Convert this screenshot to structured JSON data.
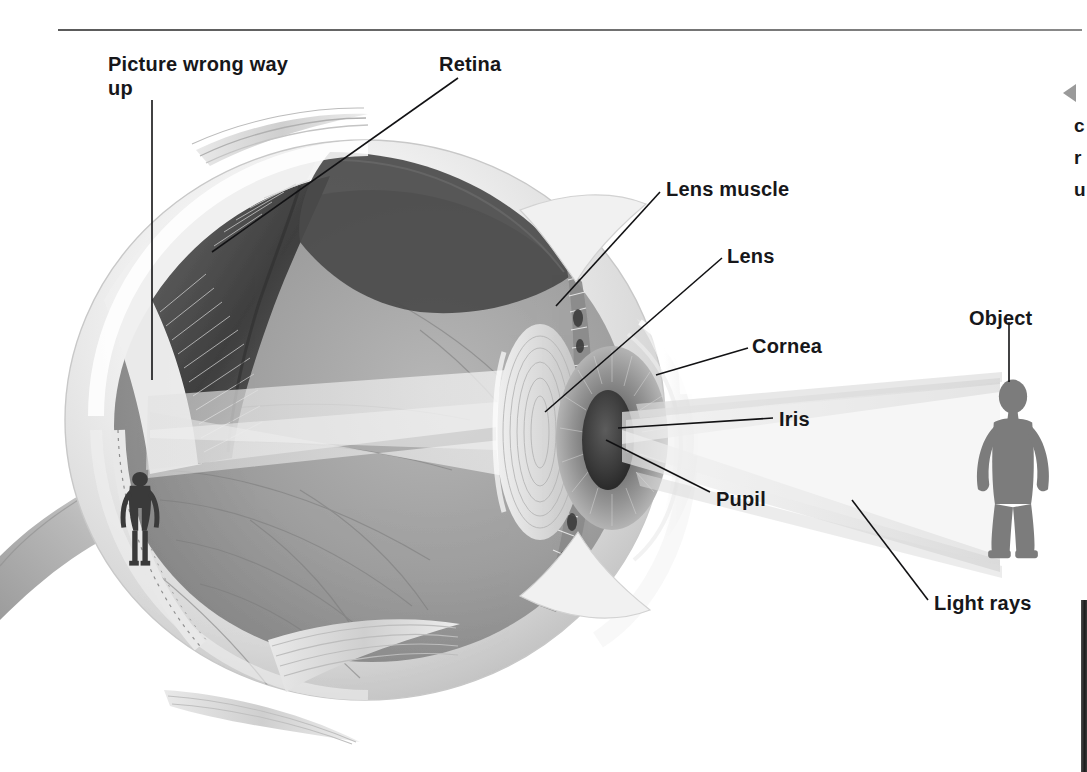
{
  "page": {
    "background_color": "#ffffff",
    "ink_color": "#17171a",
    "rule_color": "#5a5a5a"
  },
  "diagram": {
    "type": "anatomical-cutaway",
    "palette": {
      "sclera_light": "#f4f4f4",
      "sclera_mid": "#dcdcdc",
      "vitreous": "#9a9a9a",
      "choroid_dark": "#4d4d4d",
      "retina_shadow": "#6f6f6f",
      "light_ray": "#e9e9e9",
      "figure_gray": "#7c7c7c",
      "lens_gray": "#d9d9d9",
      "iris_gray": "#8e8e8e",
      "pupil_dark": "#3a3a3a"
    }
  },
  "labels": [
    {
      "id": "picture-wrong-way-up",
      "text": "Picture wrong way up",
      "x": 108,
      "y": 53
    },
    {
      "id": "retina",
      "text": "Retina",
      "x": 439,
      "y": 53
    },
    {
      "id": "lens-muscle",
      "text": "Lens muscle",
      "x": 666,
      "y": 178
    },
    {
      "id": "lens",
      "text": "Lens",
      "x": 727,
      "y": 245
    },
    {
      "id": "cornea",
      "text": "Cornea",
      "x": 752,
      "y": 335
    },
    {
      "id": "object",
      "text": "Object",
      "x": 969,
      "y": 307
    },
    {
      "id": "iris",
      "text": "Iris",
      "x": 779,
      "y": 408
    },
    {
      "id": "pupil",
      "text": "Pupil",
      "x": 716,
      "y": 498
    },
    {
      "id": "light-rays",
      "text": "Light rays",
      "x": 934,
      "y": 592
    }
  ],
  "side_note": {
    "arrow_icon": "left-triangle-icon",
    "line1": "c",
    "line2": "r",
    "line3": "u"
  },
  "anatomy_parts": [
    "sclera",
    "cornea",
    "iris",
    "pupil",
    "lens",
    "lens muscle",
    "retina",
    "choroid",
    "optic nerve",
    "extraocular muscle",
    "vitreous humour"
  ],
  "optics": {
    "object_label": "Object",
    "image_on_retina": "inverted human figure",
    "ray_paths": "two cones of light from top and bottom of object converge at the pupil, cross, and diverge onto the retina"
  }
}
